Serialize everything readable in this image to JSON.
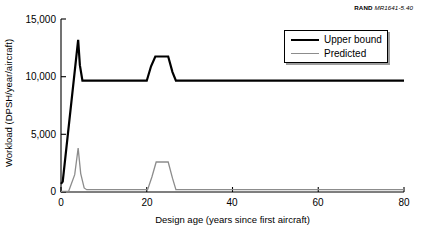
{
  "credit": {
    "publisher": "RAND",
    "document_number": "MR1641-5.40"
  },
  "chart_data": {
    "type": "line",
    "title": "",
    "subtitle": "",
    "xlabel": "Design age (years since first aircraft)",
    "ylabel": "Workload (DPSH/year/aircraft)",
    "xlim": [
      0,
      80
    ],
    "ylim": [
      0,
      15000
    ],
    "xticks": [
      0,
      20,
      40,
      60,
      80
    ],
    "xtick_labels": [
      "0",
      "20",
      "40",
      "60",
      "80"
    ],
    "yticks": [
      0,
      5000,
      10000,
      15000
    ],
    "ytick_labels": [
      "0",
      "5,000",
      "10,000",
      "15,000"
    ],
    "grid": false,
    "legend_position": "upper right",
    "series": [
      {
        "name": "Upper bound",
        "color": "#000000",
        "linewidth": 2.2,
        "x": [
          0,
          0.4,
          4.0,
          4.4,
          5.0,
          20.0,
          21.0,
          22.0,
          25.0,
          26.0,
          26.8,
          80.0
        ],
        "values": [
          700,
          900,
          13200,
          11000,
          9650,
          9650,
          10900,
          11750,
          11750,
          10400,
          9650,
          9650
        ]
      },
      {
        "name": "Predicted",
        "color": "#8c8c8c",
        "linewidth": 1.3,
        "x": [
          0,
          1.8,
          3.2,
          4.0,
          4.6,
          5.4,
          6.0,
          20.2,
          21.2,
          22.2,
          25.0,
          26.0,
          26.8,
          80.0
        ],
        "values": [
          60,
          80,
          1500,
          3800,
          1600,
          350,
          200,
          200,
          1300,
          2600,
          2600,
          1200,
          200,
          200
        ]
      }
    ],
    "annotations": []
  },
  "legend": {
    "items": [
      {
        "label": "Upper bound",
        "color": "#000000"
      },
      {
        "label": "Predicted",
        "color": "#8c8c8c"
      }
    ]
  },
  "axes_geometry": {
    "note": "pixel frame of the plot box within the 421x235 canvas",
    "left": 61,
    "right": 404,
    "top": 19,
    "bottom": 192
  }
}
